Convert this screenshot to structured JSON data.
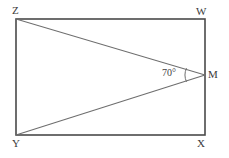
{
  "figure": {
    "kind": "geometry-diagram",
    "background_color": "#ffffff",
    "rectangle_stroke_color": "#4a4a4a",
    "diagonal_stroke_color": "#6e6e6e",
    "arc_stroke_color": "#6e6e6e",
    "label_color": "#3a3a3a",
    "rectangle": {
      "left": 16,
      "top": 19,
      "right": 205,
      "bottom": 135
    },
    "points": [
      {
        "name": "Z",
        "x": 16,
        "y": 19
      },
      {
        "name": "W",
        "x": 205,
        "y": 19
      },
      {
        "name": "X",
        "x": 205,
        "y": 135
      },
      {
        "name": "Y",
        "x": 16,
        "y": 135
      },
      {
        "name": "M",
        "x": 205,
        "y": 75
      }
    ],
    "segments": [
      {
        "name": "ZW",
        "from": "Z",
        "to": "W"
      },
      {
        "name": "WX",
        "from": "W",
        "to": "X"
      },
      {
        "name": "XY",
        "from": "X",
        "to": "Y"
      },
      {
        "name": "YZ",
        "from": "Y",
        "to": "Z"
      },
      {
        "name": "ZM",
        "from": "Z",
        "to": "M"
      },
      {
        "name": "YM",
        "from": "Y",
        "to": "M"
      }
    ],
    "labels": {
      "Z": "Z",
      "W": "W",
      "Y": "Y",
      "X": "X",
      "M": "M"
    },
    "angle": {
      "vertex": "M",
      "value": "70",
      "unit": "°",
      "text": "70°",
      "arc_x": 186,
      "arc_top_y": 68,
      "arc_bottom_y": 82
    }
  }
}
